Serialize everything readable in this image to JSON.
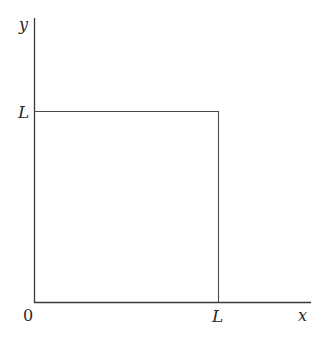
{
  "diagram": {
    "type": "square-in-first-quadrant",
    "axes": {
      "x_label": "x",
      "y_label": "y",
      "origin_label": "0"
    },
    "square": {
      "side_label_x": "L",
      "side_label_y": "L"
    },
    "colors": {
      "line": "#3a3a3a",
      "text": "#2a2a2a",
      "background": "#ffffff"
    }
  }
}
